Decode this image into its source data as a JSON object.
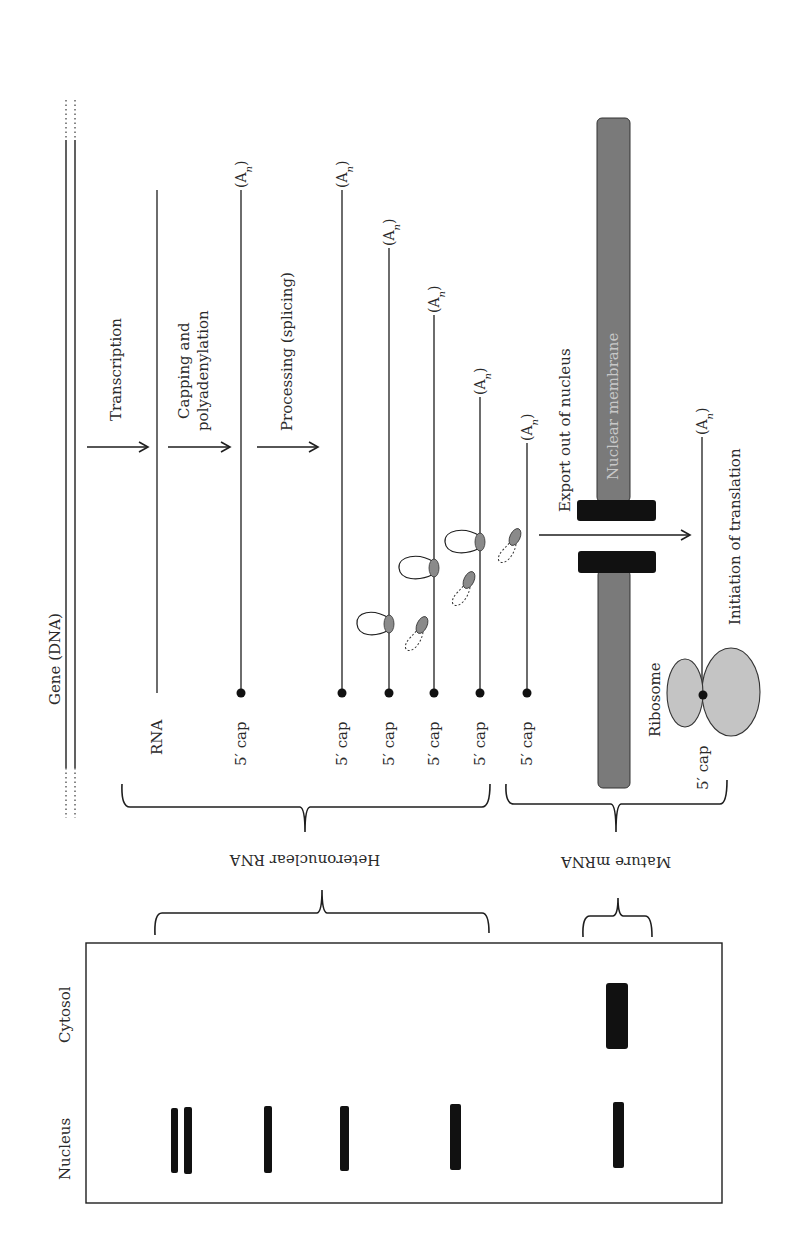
{
  "diagram": {
    "title": "",
    "gene_label": "Gene (DNA)",
    "steps": [
      {
        "id": "transcription",
        "label_lines": [
          "Transcription"
        ]
      },
      {
        "id": "capping",
        "label_lines": [
          "Capping and",
          "polyadenylation"
        ]
      },
      {
        "id": "processing",
        "label_lines": [
          "Processing (splicing)"
        ]
      },
      {
        "id": "export",
        "label_lines": [
          "Export out of nucleus"
        ]
      },
      {
        "id": "translation",
        "label_lines": [
          "Initiation of translation"
        ]
      }
    ],
    "rna_label": "RNA",
    "cap_label": "5′ cap",
    "polya_label": "(A",
    "polya_sub": "n",
    "polya_close": ")",
    "membrane_label": "Nuclear membrane",
    "ribosome_label": "Ribosome",
    "groups": {
      "hetero": "Heteronuclear RNA",
      "mature": "Mature mRNA"
    },
    "blot": {
      "lanes": [
        "Nucleus",
        "Cytosol"
      ]
    },
    "colors": {
      "line": "#1e1e1e",
      "membrane": "#7a7a7a",
      "pore": "#111111",
      "ribosome": "#c4c4c4",
      "spliceosome": "#8a8a8a"
    }
  }
}
